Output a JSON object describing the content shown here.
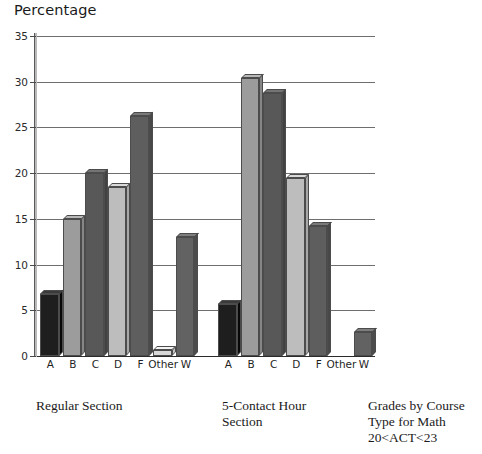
{
  "chart_data": {
    "type": "bar",
    "title": "Grades by Course Type for Math 20<ACT<23",
    "ylabel": "Percentage",
    "xlabel": "",
    "ylim": [
      0,
      35
    ],
    "yticks": [
      0,
      5,
      10,
      15,
      20,
      25,
      30,
      35
    ],
    "grid": true,
    "legend": "none",
    "categories": [
      "A",
      "B",
      "C",
      "D",
      "F",
      "Other",
      "W"
    ],
    "groups": [
      {
        "name": "Regular Section",
        "caption": "Regular Section",
        "values": [
          6.8,
          15.0,
          20.0,
          18.5,
          26.2,
          0.7,
          13.0
        ]
      },
      {
        "name": "5-Contact Hour Section",
        "caption": "5-Contact Hour\nSection",
        "values": [
          5.7,
          30.4,
          28.8,
          19.5,
          14.2,
          0.0,
          2.6
        ]
      }
    ],
    "bar_colors": {
      "A": "#1e1e1e",
      "B": "#9c9c9c",
      "C": "#585858",
      "D": "#bdbdbd",
      "F": "#5e5e5e",
      "Other": "#d8d8d8",
      "W": "#626262"
    }
  },
  "axis": {
    "title": "Percentage",
    "tick_labels": [
      "0",
      "5",
      "10",
      "15",
      "20",
      "25",
      "30",
      "35"
    ]
  },
  "captions": {
    "group_1": "Regular Section",
    "group_2": "5-Contact Hour\nSection",
    "title_block": "Grades by Course\nType for Math\n20<ACT<23"
  }
}
